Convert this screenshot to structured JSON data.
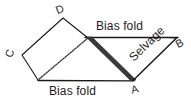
{
  "diagram": {
    "background_color": "#ffffff",
    "line_color": "#1a1a1a",
    "shadow_color": "#3d3d3d",
    "dotted_color": "#8a8a8a",
    "vertices": [
      {
        "id": "D",
        "label": "D",
        "x": 63,
        "y": 17
      },
      {
        "id": "C",
        "label": "C",
        "x": 22,
        "y": 55
      },
      {
        "id": "A",
        "label": "A",
        "x": 133,
        "y": 80
      },
      {
        "id": "B",
        "label": "B",
        "x": 176,
        "y": 38
      }
    ],
    "edge_labels": {
      "bias_fold_top": "Bias fold",
      "bias_fold_bottom": "Bias fold",
      "selvage": "Selvage"
    }
  }
}
